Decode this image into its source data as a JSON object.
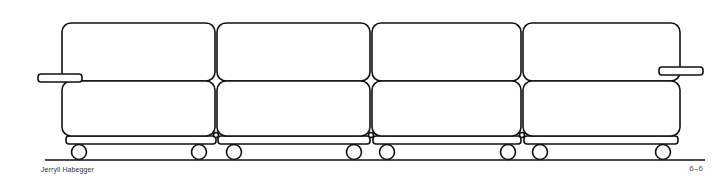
{
  "drawing": {
    "subject": "modular sofa line drawing",
    "modules": 4,
    "stroke_color": "#111111",
    "background": "#ffffff"
  },
  "captions": {
    "credit": "Jerryll Habegger",
    "figure_number": "6–6"
  }
}
